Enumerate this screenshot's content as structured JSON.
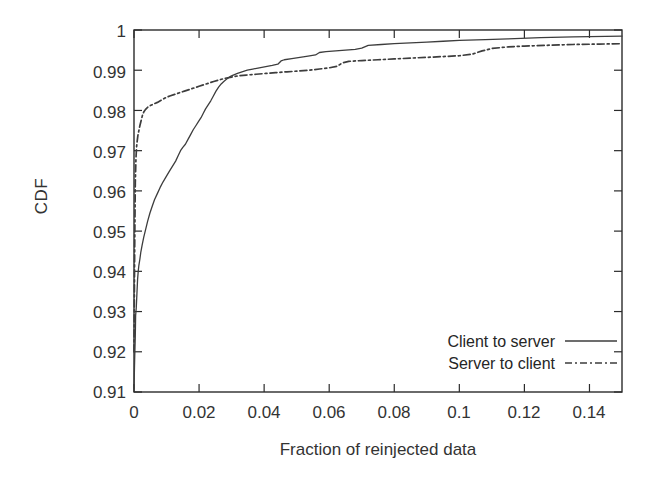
{
  "chart_data": {
    "type": "line",
    "title": "",
    "xlabel": "Fraction of reinjected data",
    "ylabel": "CDF",
    "xlim": [
      0,
      0.15
    ],
    "ylim": [
      0.91,
      1
    ],
    "xticks": [
      "0",
      "0.02",
      "0.04",
      "0.06",
      "0.08",
      "0.1",
      "0.12",
      "0.14"
    ],
    "xtick_values": [
      0,
      0.02,
      0.04,
      0.06,
      0.08,
      0.1,
      0.12,
      0.14
    ],
    "yticks": [
      "0.91",
      "0.92",
      "0.93",
      "0.94",
      "0.95",
      "0.96",
      "0.97",
      "0.98",
      "0.99",
      "1"
    ],
    "ytick_values": [
      0.91,
      0.92,
      0.93,
      0.94,
      0.95,
      0.96,
      0.97,
      0.98,
      0.99,
      1
    ],
    "grid": false,
    "legend_position": "lower right",
    "series": [
      {
        "name": "Client to server",
        "style": "solid",
        "color": "#3d3d3d",
        "points": [
          [
            0.0,
            0.911
          ],
          [
            0.0002,
            0.918
          ],
          [
            0.0004,
            0.924
          ],
          [
            0.0005,
            0.929
          ],
          [
            0.0007,
            0.931
          ],
          [
            0.0009,
            0.9345
          ],
          [
            0.0011,
            0.938
          ],
          [
            0.0013,
            0.94
          ],
          [
            0.0015,
            0.9415
          ],
          [
            0.0018,
            0.943
          ],
          [
            0.0021,
            0.9448
          ],
          [
            0.0025,
            0.9465
          ],
          [
            0.003,
            0.9485
          ],
          [
            0.0036,
            0.9505
          ],
          [
            0.0042,
            0.9525
          ],
          [
            0.0049,
            0.9545
          ],
          [
            0.0056,
            0.9562
          ],
          [
            0.0063,
            0.9578
          ],
          [
            0.0071,
            0.9592
          ],
          [
            0.008,
            0.9608
          ],
          [
            0.0089,
            0.9622
          ],
          [
            0.0098,
            0.9634
          ],
          [
            0.0108,
            0.9648
          ],
          [
            0.0118,
            0.9661
          ],
          [
            0.0128,
            0.9674
          ],
          [
            0.0136,
            0.9688
          ],
          [
            0.0143,
            0.97
          ],
          [
            0.015,
            0.9708
          ],
          [
            0.0158,
            0.9716
          ],
          [
            0.0166,
            0.9728
          ],
          [
            0.0174,
            0.974
          ],
          [
            0.0182,
            0.9752
          ],
          [
            0.019,
            0.9762
          ],
          [
            0.0198,
            0.9772
          ],
          [
            0.0206,
            0.9782
          ],
          [
            0.0213,
            0.9793
          ],
          [
            0.022,
            0.9804
          ],
          [
            0.0228,
            0.9814
          ],
          [
            0.0236,
            0.9824
          ],
          [
            0.0244,
            0.9836
          ],
          [
            0.0252,
            0.9848
          ],
          [
            0.026,
            0.9858
          ],
          [
            0.0268,
            0.9866
          ],
          [
            0.0276,
            0.9872
          ],
          [
            0.0285,
            0.9878
          ],
          [
            0.0295,
            0.9884
          ],
          [
            0.0305,
            0.9888
          ],
          [
            0.0318,
            0.9892
          ],
          [
            0.0332,
            0.9896
          ],
          [
            0.0348,
            0.99
          ],
          [
            0.0365,
            0.9903
          ],
          [
            0.0385,
            0.9906
          ],
          [
            0.0405,
            0.9909
          ],
          [
            0.0425,
            0.9912
          ],
          [
            0.0442,
            0.9915
          ],
          [
            0.0452,
            0.9923
          ],
          [
            0.0462,
            0.9926
          ],
          [
            0.0485,
            0.9929
          ],
          [
            0.051,
            0.9932
          ],
          [
            0.0535,
            0.9935
          ],
          [
            0.0558,
            0.9938
          ],
          [
            0.057,
            0.9944
          ],
          [
            0.059,
            0.9946
          ],
          [
            0.062,
            0.9948
          ],
          [
            0.065,
            0.995
          ],
          [
            0.068,
            0.9952
          ],
          [
            0.07,
            0.9955
          ],
          [
            0.072,
            0.9962
          ],
          [
            0.076,
            0.9964
          ],
          [
            0.08,
            0.9966
          ],
          [
            0.085,
            0.9968
          ],
          [
            0.09,
            0.997
          ],
          [
            0.095,
            0.9972
          ],
          [
            0.1,
            0.9974
          ],
          [
            0.108,
            0.9976
          ],
          [
            0.115,
            0.9978
          ],
          [
            0.125,
            0.9981
          ],
          [
            0.135,
            0.9983
          ],
          [
            0.145,
            0.9984
          ],
          [
            0.15,
            0.9985
          ]
        ]
      },
      {
        "name": "Server to client",
        "style": "dashdot",
        "color": "#3d3d3d",
        "points": [
          [
            0.0,
            0.92
          ],
          [
            0.0002,
            0.945
          ],
          [
            0.0004,
            0.962
          ],
          [
            0.0006,
            0.968
          ],
          [
            0.0008,
            0.971
          ],
          [
            0.001,
            0.9725
          ],
          [
            0.0012,
            0.9738
          ],
          [
            0.0015,
            0.975
          ],
          [
            0.0018,
            0.9762
          ],
          [
            0.0022,
            0.9775
          ],
          [
            0.0026,
            0.9788
          ],
          [
            0.003,
            0.9796
          ],
          [
            0.0035,
            0.9802
          ],
          [
            0.0042,
            0.9808
          ],
          [
            0.005,
            0.9812
          ],
          [
            0.006,
            0.9816
          ],
          [
            0.0072,
            0.982
          ],
          [
            0.0085,
            0.9826
          ],
          [
            0.0098,
            0.9832
          ],
          [
            0.011,
            0.9836
          ],
          [
            0.0125,
            0.984
          ],
          [
            0.014,
            0.9844
          ],
          [
            0.0155,
            0.9848
          ],
          [
            0.017,
            0.9852
          ],
          [
            0.0185,
            0.9856
          ],
          [
            0.02,
            0.986
          ],
          [
            0.0215,
            0.9864
          ],
          [
            0.023,
            0.9868
          ],
          [
            0.0245,
            0.9872
          ],
          [
            0.0262,
            0.9876
          ],
          [
            0.028,
            0.988
          ],
          [
            0.03,
            0.9883
          ],
          [
            0.032,
            0.9886
          ],
          [
            0.0345,
            0.9888
          ],
          [
            0.0375,
            0.989
          ],
          [
            0.0405,
            0.9892
          ],
          [
            0.0435,
            0.9894
          ],
          [
            0.047,
            0.9896
          ],
          [
            0.0505,
            0.9898
          ],
          [
            0.054,
            0.99
          ],
          [
            0.057,
            0.9903
          ],
          [
            0.06,
            0.9906
          ],
          [
            0.0625,
            0.991
          ],
          [
            0.064,
            0.9918
          ],
          [
            0.066,
            0.9922
          ],
          [
            0.07,
            0.9924
          ],
          [
            0.075,
            0.9926
          ],
          [
            0.08,
            0.9928
          ],
          [
            0.085,
            0.993
          ],
          [
            0.09,
            0.9932
          ],
          [
            0.095,
            0.9934
          ],
          [
            0.1,
            0.9936
          ],
          [
            0.104,
            0.994
          ],
          [
            0.107,
            0.9948
          ],
          [
            0.11,
            0.9954
          ],
          [
            0.115,
            0.9958
          ],
          [
            0.12,
            0.996
          ],
          [
            0.127,
            0.9962
          ],
          [
            0.135,
            0.9964
          ],
          [
            0.143,
            0.9965
          ],
          [
            0.15,
            0.9966
          ]
        ]
      }
    ]
  },
  "legend": {
    "items": [
      {
        "label": "Client to server",
        "style": "solid"
      },
      {
        "label": "Server to client",
        "style": "dashdot"
      }
    ]
  },
  "axis_colors": {
    "frame": "#2b2b2b",
    "line": "#3d3d3d",
    "text": "#333333",
    "background": "#ffffff"
  }
}
